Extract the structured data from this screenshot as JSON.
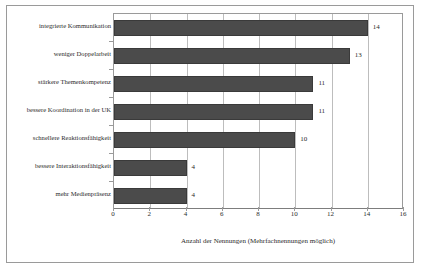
{
  "chart_data": {
    "type": "bar",
    "orientation": "horizontal",
    "title": "",
    "subtitle": "",
    "xlabel": "Anzahl der Nennungen (Mehrfachnennungen möglich)",
    "ylabel": "",
    "categories": [
      "integrierte Kommunikation",
      "weniger Doppelarbeit",
      "stärkere Themenkompetenz",
      "bessere Koordination in der UK",
      "schnellere Reaktionsfähigkeit",
      "bessere Interaktionsfähigkeit",
      "mehr Medienpräsenz"
    ],
    "values": [
      14,
      13,
      11,
      11,
      10,
      4,
      4
    ],
    "data_labels": [
      "14",
      "13",
      "11",
      "11",
      "10",
      "4",
      "4"
    ],
    "xlim": [
      0,
      16
    ],
    "xticks": [
      0,
      2,
      4,
      6,
      8,
      10,
      12,
      14,
      16
    ],
    "xtick_labels": [
      "0",
      "2",
      "4",
      "6",
      "8",
      "10",
      "12",
      "14",
      "16"
    ],
    "grid": "vertical",
    "legend": "none",
    "bar_color": "#4b4b4b",
    "grid_color": "#bdbdbd",
    "axis_color": "#9a9a9a",
    "text_color": "#2b2b2b",
    "background_color": "#ffffff"
  }
}
